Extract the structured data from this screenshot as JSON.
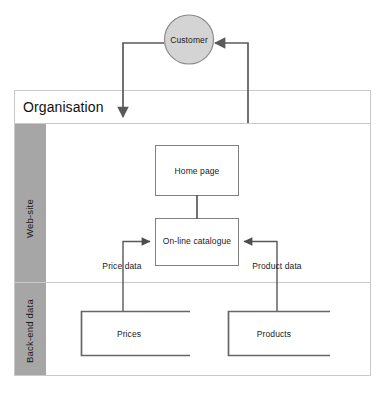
{
  "diagram": {
    "type": "data-flow-diagram"
  },
  "actor": {
    "label": "Customer",
    "shape": "circle",
    "fill": "#d4d4d4",
    "stroke": "#8a8a8a"
  },
  "frame": {
    "header_label": "Organisation",
    "border_color": "#bfbfbf",
    "header_border_color": "#c9c9c9"
  },
  "bands": [
    {
      "label": "Web-site",
      "fill": "#a6a6a6"
    },
    {
      "label": "Back-end data",
      "fill": "#a6a6a6"
    }
  ],
  "processes": [
    {
      "id": "home",
      "label": "Home page",
      "stroke": "#808080",
      "fill": "#ffffff"
    },
    {
      "id": "catalogue",
      "label": "On-line catalogue",
      "stroke": "#808080",
      "fill": "#ffffff"
    }
  ],
  "datastores": [
    {
      "id": "prices",
      "label": "Prices",
      "stroke": "#666666"
    },
    {
      "id": "products",
      "label": "Products",
      "stroke": "#666666"
    }
  ],
  "flows": [
    {
      "id": "price-data",
      "label": "Price data"
    },
    {
      "id": "product-data",
      "label": "Product data"
    }
  ],
  "colors": {
    "line": "#595959",
    "thin_line": "#808080",
    "page_background": "#ffffff"
  }
}
